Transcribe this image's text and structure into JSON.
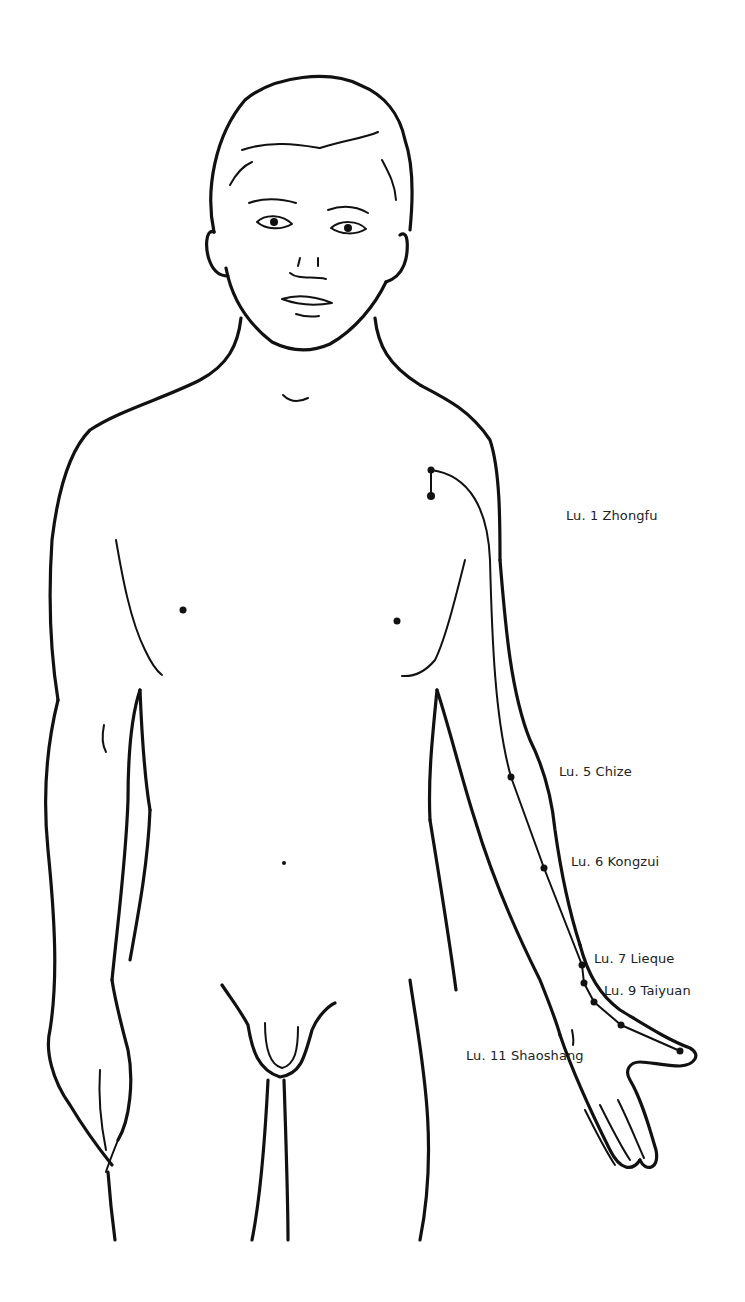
{
  "diagram": {
    "line_color": "#111111",
    "background": "#ffffff"
  },
  "points": [
    {
      "id": "lu1",
      "label": "Lu. 1 Zhongfu",
      "x": 431,
      "y": 496,
      "label_x": 566,
      "label_y": 508
    },
    {
      "id": "lu5",
      "label": "Lu. 5 Chize",
      "x": 511,
      "y": 777,
      "label_x": 559,
      "label_y": 764
    },
    {
      "id": "lu6",
      "label": "Lu. 6 Kongzui",
      "x": 544,
      "y": 868,
      "label_x": 571,
      "label_y": 854
    },
    {
      "id": "lu7",
      "label": "Lu. 7 Lieque",
      "x": 582,
      "y": 965,
      "label_x": 594,
      "label_y": 951
    },
    {
      "id": "lu9",
      "label": "Lu. 9 Taiyuan",
      "x": 584,
      "y": 983,
      "label_x": 604,
      "label_y": 983
    },
    {
      "id": "lu11",
      "label": "Lu. 11 Shaoshang",
      "x": 680,
      "y": 1051,
      "label_x": 466,
      "label_y": 1048
    }
  ]
}
